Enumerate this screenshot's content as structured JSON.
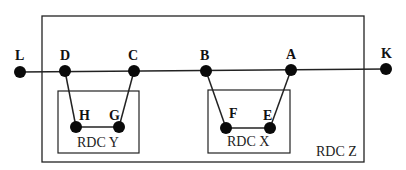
{
  "diagram": {
    "colors": {
      "line": "#222222",
      "node": "#0a0a0a",
      "background": "#ffffff"
    },
    "boxes": [
      {
        "id": "Z",
        "label": "RDC Z",
        "x": 42,
        "y": 16,
        "w": 322,
        "h": 146
      },
      {
        "id": "Y",
        "label": "RDC Y",
        "x": 58,
        "y": 91,
        "w": 81,
        "h": 62
      },
      {
        "id": "X",
        "label": "RDC X",
        "x": 208,
        "y": 90,
        "w": 82,
        "h": 63
      }
    ],
    "nodes": [
      {
        "id": "L",
        "label": "L",
        "x": 20,
        "y": 72
      },
      {
        "id": "D",
        "label": "D",
        "x": 65,
        "y": 71
      },
      {
        "id": "C",
        "label": "C",
        "x": 134,
        "y": 71
      },
      {
        "id": "B",
        "label": "B",
        "x": 206,
        "y": 71
      },
      {
        "id": "A",
        "label": "A",
        "x": 291,
        "y": 70
      },
      {
        "id": "K",
        "label": "K",
        "x": 386,
        "y": 69
      },
      {
        "id": "H",
        "label": "H",
        "x": 76,
        "y": 127
      },
      {
        "id": "G",
        "label": "G",
        "x": 119,
        "y": 127
      },
      {
        "id": "F",
        "label": "F",
        "x": 226,
        "y": 128
      },
      {
        "id": "E",
        "label": "E",
        "x": 270,
        "y": 128
      }
    ],
    "edges": [
      [
        "L",
        "K"
      ],
      [
        "D",
        "H"
      ],
      [
        "H",
        "G"
      ],
      [
        "G",
        "C"
      ],
      [
        "B",
        "F"
      ],
      [
        "F",
        "E"
      ],
      [
        "E",
        "A"
      ]
    ]
  }
}
